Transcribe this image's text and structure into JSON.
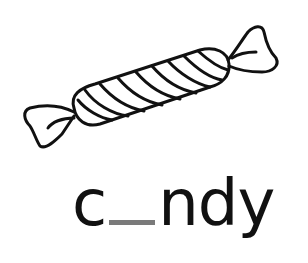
{
  "illustration": {
    "subject": "wrapped candy",
    "icon": "candy-icon",
    "stroke_color": "#111111"
  },
  "word": {
    "prefix": "c",
    "missing_letter_placeholder": "_",
    "suffix": "ndy",
    "blank_color": "#7a7a7a",
    "text_color": "#111111"
  }
}
